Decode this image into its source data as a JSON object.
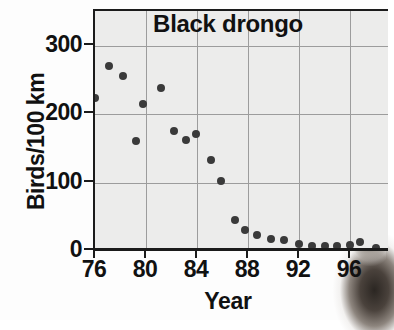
{
  "chart_data": {
    "type": "scatter",
    "title": "Black drongo",
    "xlabel": "Year",
    "ylabel": "Birds/100 km",
    "xlim": [
      75.6,
      99.0
    ],
    "ylim": [
      0,
      351
    ],
    "xticks": [
      "76",
      "80",
      "84",
      "88",
      "92",
      "96"
    ],
    "xtick_values": [
      76,
      80,
      84,
      88,
      92,
      96
    ],
    "yticks": [
      "0",
      "100",
      "200",
      "300"
    ],
    "ytick_values": [
      0,
      100,
      200,
      300
    ],
    "grid": "vertical and horizontal gridlines at major ticks",
    "legend": "none",
    "marker_color": "#3a3a3a",
    "panel_color": "#ececeb",
    "axis_color": "#1b1b1b",
    "x": [
      76.0,
      77.1,
      78.2,
      79.2,
      79.8,
      81.2,
      82.2,
      83.1,
      83.9,
      85.1,
      85.9,
      87.0,
      87.8,
      88.7,
      89.8,
      90.8,
      92.0,
      93.0,
      94.0,
      95.0,
      96.0,
      96.8,
      98.0
    ],
    "y": [
      224,
      271,
      256,
      161,
      215,
      239,
      176,
      162,
      171,
      133,
      103,
      45,
      31,
      23,
      18,
      16,
      10,
      7,
      7,
      7,
      9,
      13,
      4
    ],
    "points": [
      {
        "year": 76.0,
        "value": 224
      },
      {
        "year": 77.1,
        "value": 271
      },
      {
        "year": 78.2,
        "value": 256
      },
      {
        "year": 79.2,
        "value": 161
      },
      {
        "year": 79.8,
        "value": 215
      },
      {
        "year": 81.2,
        "value": 239
      },
      {
        "year": 82.2,
        "value": 176
      },
      {
        "year": 83.1,
        "value": 162
      },
      {
        "year": 83.9,
        "value": 171
      },
      {
        "year": 85.1,
        "value": 133
      },
      {
        "year": 85.9,
        "value": 103
      },
      {
        "year": 87.0,
        "value": 45
      },
      {
        "year": 87.8,
        "value": 31
      },
      {
        "year": 88.7,
        "value": 23
      },
      {
        "year": 89.8,
        "value": 18
      },
      {
        "year": 90.8,
        "value": 16
      },
      {
        "year": 92.0,
        "value": 10
      },
      {
        "year": 93.0,
        "value": 7
      },
      {
        "year": 94.0,
        "value": 7
      },
      {
        "year": 95.0,
        "value": 7
      },
      {
        "year": 96.0,
        "value": 9
      },
      {
        "year": 96.8,
        "value": 13
      },
      {
        "year": 98.0,
        "value": 4
      }
    ]
  }
}
